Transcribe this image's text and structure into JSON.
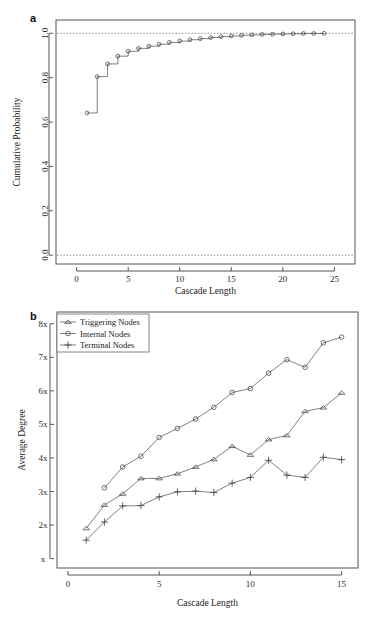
{
  "figure": {
    "panel_a_label": "a",
    "panel_b_label": "b"
  },
  "chart_data": [
    {
      "id": "panel_a",
      "type": "line",
      "title": "",
      "xlabel": "Cascade Length",
      "ylabel": "Cumulative Probability",
      "xlim": [
        -2,
        27
      ],
      "ylim": [
        -0.04,
        1.06
      ],
      "xticks": [
        0,
        5,
        10,
        15,
        20,
        25
      ],
      "xticklabels": [
        "0",
        "5",
        "10",
        "15",
        "20",
        "25"
      ],
      "yticks": [
        0.0,
        0.2,
        0.4,
        0.6,
        0.8,
        1.0
      ],
      "yticklabels": [
        "0.0",
        "0.2",
        "0.4",
        "0.6",
        "0.8",
        "1.0"
      ],
      "grid": false,
      "legend": "none",
      "marker": "circle-open",
      "step": true,
      "reference_lines": [
        {
          "y": 1.0,
          "style": "dashed"
        },
        {
          "y": 0.0,
          "style": "dashed"
        }
      ],
      "x": [
        1,
        2,
        3,
        4,
        5,
        6,
        7,
        8,
        9,
        10,
        11,
        12,
        13,
        14,
        15,
        16,
        17,
        18,
        19,
        20,
        21,
        22,
        23,
        24
      ],
      "values": [
        0.641,
        0.805,
        0.862,
        0.897,
        0.919,
        0.932,
        0.942,
        0.951,
        0.959,
        0.965,
        0.971,
        0.976,
        0.981,
        0.985,
        0.988,
        0.991,
        0.993,
        0.995,
        0.996,
        0.997,
        0.998,
        0.999,
        0.999,
        1.0
      ]
    },
    {
      "id": "panel_b",
      "type": "line",
      "title": "",
      "xlabel": "Cascade Length",
      "ylabel": "Average Degree",
      "xlim": [
        -0.6,
        15.9
      ],
      "ylim": [
        0.72,
        8.35
      ],
      "xticks": [
        0,
        5,
        10,
        15
      ],
      "xticklabels": [
        "0",
        "5",
        "10",
        "15"
      ],
      "yticks": [
        1,
        2,
        3,
        4,
        5,
        6,
        7,
        8
      ],
      "yticklabels": [
        "x",
        "2x",
        "3x",
        "4x",
        "5x",
        "6x",
        "7x",
        "8x"
      ],
      "grid": false,
      "legend": "upper left",
      "categories": [
        1,
        2,
        3,
        4,
        5,
        6,
        7,
        8,
        9,
        10,
        11,
        12,
        13,
        14,
        15
      ],
      "series": [
        {
          "name": "Triggering Nodes",
          "marker": "triangle-open",
          "values": [
            1.9,
            2.6,
            2.93,
            3.39,
            3.39,
            3.53,
            3.73,
            3.96,
            4.35,
            4.09,
            4.55,
            4.67,
            5.39,
            5.5,
            5.94
          ]
        },
        {
          "name": "Internal Nodes",
          "marker": "circle-open",
          "values": [
            null,
            3.11,
            3.73,
            4.05,
            4.61,
            4.88,
            5.16,
            5.51,
            5.95,
            6.07,
            6.53,
            6.93,
            6.7,
            7.43,
            7.6
          ]
        },
        {
          "name": "Terminal Nodes",
          "marker": "plus",
          "values": [
            1.55,
            2.09,
            2.57,
            2.58,
            2.84,
            2.99,
            3.01,
            2.97,
            3.25,
            3.42,
            3.93,
            3.49,
            3.42,
            4.02,
            3.95
          ]
        }
      ]
    }
  ]
}
